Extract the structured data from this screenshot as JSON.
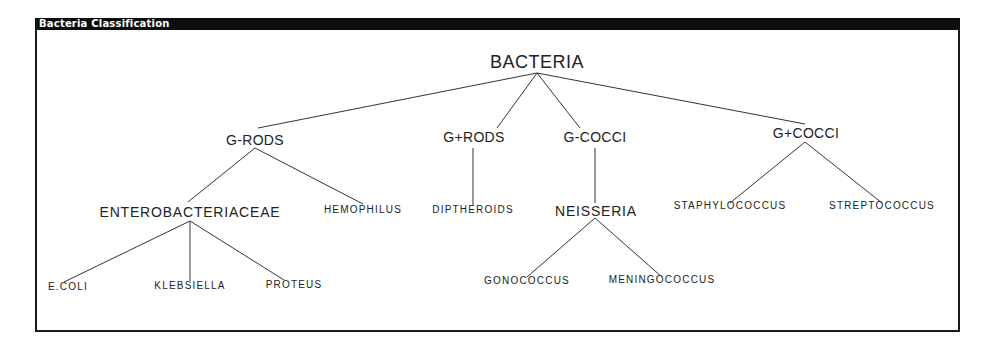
{
  "window": {
    "title": "Bacteria Classification"
  },
  "tree": {
    "root": "BACTERIA",
    "level1": {
      "g_rods": "G-RODS",
      "g_plus_rods": "G+RODS",
      "g_cocci": "G-COCCI",
      "g_plus_cocci": "G+COCCI"
    },
    "level2": {
      "enterobacteriaceae": "ENTEROBACTERIACEAE",
      "hemophilus": "HEMOPHILUS",
      "diptheroids": "DIPTHEROIDS",
      "neisseria": "NEISSERIA",
      "staphylococcus": "STAPHYLOCOCCUS",
      "streptococcus": "STREPTOCOCCUS"
    },
    "level3": {
      "ecoli": "E.COLI",
      "klebsiella": "KLEBSIELLA",
      "proteus": "PROTEUS",
      "gonococcus": "GONOCOCCUS",
      "meningococcus": "MENINGOCOCCUS"
    },
    "edges": [
      [
        "BACTERIA",
        "G-RODS"
      ],
      [
        "BACTERIA",
        "G+RODS"
      ],
      [
        "BACTERIA",
        "G-COCCI"
      ],
      [
        "BACTERIA",
        "G+COCCI"
      ],
      [
        "G-RODS",
        "ENTEROBACTERIACEAE"
      ],
      [
        "G-RODS",
        "HEMOPHILUS"
      ],
      [
        "G+RODS",
        "DIPTHEROIDS"
      ],
      [
        "G-COCCI",
        "NEISSERIA"
      ],
      [
        "G+COCCI",
        "STAPHYLOCOCCUS"
      ],
      [
        "G+COCCI",
        "STREPTOCOCCUS"
      ],
      [
        "ENTEROBACTERIACEAE",
        "E.COLI"
      ],
      [
        "ENTEROBACTERIACEAE",
        "KLEBSIELLA"
      ],
      [
        "ENTEROBACTERIACEAE",
        "PROTEUS"
      ],
      [
        "NEISSERIA",
        "GONOCOCCUS"
      ],
      [
        "NEISSERIA",
        "MENINGOCOCCUS"
      ]
    ]
  }
}
